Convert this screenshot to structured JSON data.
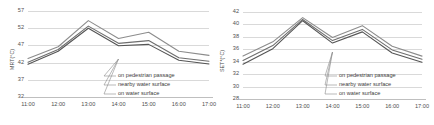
{
  "chart_data": [
    {
      "type": "line",
      "panel": "left",
      "title": "",
      "xlabel": "",
      "ylabel": "MRT(°C)",
      "categories": [
        "11:00",
        "12:00",
        "13:00",
        "14:00",
        "15:00",
        "16:00",
        "17:00"
      ],
      "yticks": [
        32,
        37,
        42,
        47,
        52,
        57
      ],
      "ylim": [
        32,
        57
      ],
      "grid": true,
      "legend_position": "inside-lower-right",
      "series": [
        {
          "name": "on pedestrian passage",
          "color": "#8c8c8c",
          "values": [
            43.2,
            46.6,
            54.2,
            49.0,
            50.8,
            45.3,
            44.1
          ]
        },
        {
          "name": "nearby water surface",
          "color": "#6e6e6e",
          "values": [
            42.1,
            45.8,
            52.6,
            47.6,
            48.4,
            43.4,
            42.4
          ]
        },
        {
          "name": "on water surface",
          "color": "#555555",
          "values": [
            41.5,
            45.3,
            52.0,
            46.9,
            47.3,
            42.7,
            41.6
          ]
        }
      ]
    },
    {
      "type": "line",
      "panel": "right",
      "title": "",
      "xlabel": "",
      "ylabel": "SET*(°C)",
      "categories": [
        "11:00",
        "12:00",
        "13:00",
        "14:00",
        "15:00",
        "16:00",
        "17:00"
      ],
      "yticks": [
        28,
        30,
        32,
        34,
        36,
        38,
        40,
        42
      ],
      "ylim": [
        28,
        42
      ],
      "grid": true,
      "legend_position": "inside-lower-right",
      "series": [
        {
          "name": "on pedestrian passage",
          "color": "#8c8c8c",
          "values": [
            34.9,
            37.2,
            41.1,
            37.9,
            39.8,
            36.5,
            34.9
          ]
        },
        {
          "name": "nearby water surface",
          "color": "#6e6e6e",
          "values": [
            34.2,
            36.6,
            40.8,
            37.4,
            39.2,
            35.9,
            34.4
          ]
        },
        {
          "name": "on water surface",
          "color": "#555555",
          "values": [
            33.6,
            36.1,
            40.6,
            37.0,
            38.8,
            35.4,
            33.9
          ]
        }
      ]
    }
  ]
}
